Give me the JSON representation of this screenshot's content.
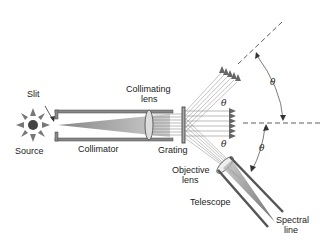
{
  "diagram": {
    "type": "grating-spectrometer",
    "labels": {
      "source": "Source",
      "slit": "Slit",
      "collimator": "Collimator",
      "collimating_lens": "Collimating lens",
      "collimating_lens_line1": "Collimating",
      "collimating_lens_line2": "lens",
      "grating": "Grating",
      "objective_lens_line1": "Objective",
      "objective_lens_line2": "lens",
      "telescope": "Telescope",
      "spectral_line_line1": "Spectral",
      "spectral_line_line2": "line"
    },
    "angles": {
      "theta_upper_outer": "θ",
      "theta_upper_inner": "θ",
      "theta_lower_inner": "θ",
      "theta_lower_outer": "θ"
    },
    "colors": {
      "stroke": "#333333",
      "rays": "#777777",
      "tube_fill": "#888888",
      "lens_fill": "#dddddd"
    }
  }
}
